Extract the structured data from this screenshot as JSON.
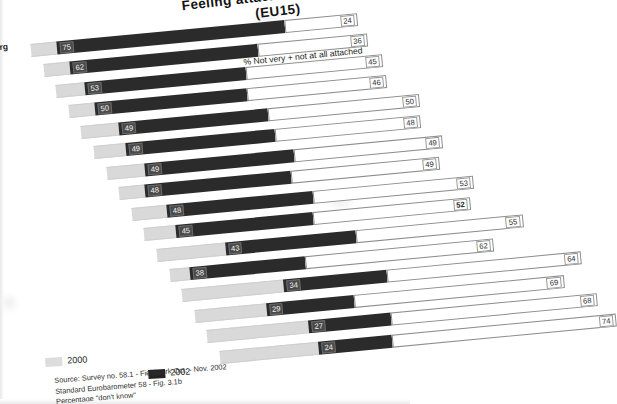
{
  "chart_data": {
    "type": "bar",
    "title": "Feeling attached to Europe",
    "subtitle": "(EU15)",
    "left_axis_caption": "% Very + fairly attached",
    "right_axis_caption": "% Not very + not at all attached",
    "xlabel": "",
    "ylabel": "",
    "grid": false,
    "legend_position": "bottom",
    "orientation": "horizontal",
    "stacked": true,
    "xlim": [
      0,
      100
    ],
    "legend": [
      {
        "label": "2000",
        "color": "#dcdcdc"
      },
      {
        "label": "2002",
        "color": "#232323"
      }
    ],
    "series": [
      {
        "name": "2000",
        "values": [
          79,
          66,
          58,
          54,
          57,
          55,
          57,
          52,
          55,
          51,
          61,
          40,
          63,
          48,
          56
        ]
      },
      {
        "name": "2002",
        "values": [
          75,
          62,
          53,
          50,
          49,
          49,
          49,
          48,
          48,
          45,
          43,
          38,
          34,
          29,
          27
        ]
      },
      {
        "name": "Not very + not at all attached",
        "values": [
          24,
          36,
          45,
          46,
          50,
          48,
          48,
          49,
          49,
          53,
          52,
          55,
          62,
          64,
          69
        ]
      }
    ],
    "rows": [
      {
        "v2000": 79,
        "v2002": 75,
        "not_attached": 24,
        "bold": false
      },
      {
        "v2000": 66,
        "v2002": 62,
        "not_attached": 36,
        "bold": false
      },
      {
        "v2000": 58,
        "v2002": 53,
        "not_attached": 45,
        "bold": false
      },
      {
        "v2000": 54,
        "v2002": 50,
        "not_attached": 46,
        "bold": false
      },
      {
        "v2000": 57,
        "v2002": 49,
        "not_attached": 50,
        "bold": false
      },
      {
        "v2000": 55,
        "v2002": 49,
        "not_attached": 48,
        "bold": false
      },
      {
        "v2000": 57,
        "v2002": 49,
        "not_attached": 49,
        "bold": false
      },
      {
        "v2000": 52,
        "v2002": 48,
        "not_attached": 49,
        "bold": false
      },
      {
        "v2000": 55,
        "v2002": 48,
        "not_attached": 53,
        "bold": false
      },
      {
        "v2000": 51,
        "v2002": 45,
        "not_attached": 52,
        "bold": true
      },
      {
        "v2000": 61,
        "v2002": 43,
        "not_attached": 55,
        "bold": false
      },
      {
        "v2000": 40,
        "v2002": 38,
        "not_attached": 62,
        "bold": false
      },
      {
        "v2000": 63,
        "v2002": 34,
        "not_attached": 64,
        "bold": false
      },
      {
        "v2000": 48,
        "v2002": 29,
        "not_attached": 69,
        "bold": false
      },
      {
        "v2000": 56,
        "v2002": 27,
        "not_attached": 68,
        "bold": false
      },
      {
        "v2000": 52,
        "v2002": 24,
        "not_attached": 74,
        "bold": false
      }
    ]
  },
  "edge_label": "rg",
  "source": {
    "line1": "Source: Survey no. 58.1 -  Fieldwork Oct. - Nov. 2002",
    "line2": "Standard Eurobarometer 58 - Fig. 3.1b",
    "line3": "Percentage \"don't know\""
  }
}
